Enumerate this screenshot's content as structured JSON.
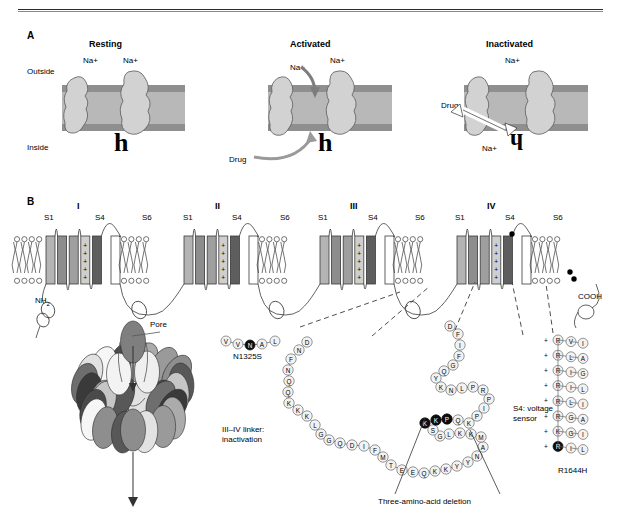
{
  "figure": {
    "panel_a_letter": "A",
    "panel_b_letter": "B"
  },
  "panel_a": {
    "states": [
      {
        "title": "Resting",
        "na_labels": [
          "Na+",
          "Na+"
        ],
        "gate_letter_top": "3",
        "gate_letter_bottom": "h",
        "r_letter": "R"
      },
      {
        "title": "Activated",
        "na_labels": [
          "Na+",
          "Na+"
        ],
        "gate_letter_top": "3",
        "gate_letter_bottom": "h",
        "r_letter": "R",
        "drug_label": "Drug"
      },
      {
        "title": "Inactivated",
        "na_labels": [
          "Na+",
          "Na+"
        ],
        "gate_letter_top": "3",
        "gate_letter_bottom": "h",
        "r_letter": "R",
        "drug_label": "Drug"
      }
    ],
    "outside_label": "Outside",
    "inside_label": "Inside",
    "membrane_color": "#b8b8b8",
    "membrane_edge_color": "#8f8f8f",
    "protein_fill": "#d2d2d2"
  },
  "panel_b": {
    "domain_labels": [
      "I",
      "II",
      "III",
      "IV"
    ],
    "segment_labels": [
      "S1",
      "S4",
      "S6"
    ],
    "terminus_n": "NH2",
    "terminus_c": "COOH",
    "colors": {
      "s1": "#b4b4b4",
      "s2": "#8d8d8d",
      "s3": "#9f9f9f",
      "s4": "#cfcfcf",
      "s5": "#5e5e5e",
      "s6": "#ffffff",
      "stroke": "#3a3a3a"
    },
    "s4_plus": "+"
  },
  "pore": {
    "label": "Pore"
  },
  "mutations": {
    "n1325s": {
      "label": "N1325S",
      "residues": [
        "V",
        "V",
        "N",
        "A",
        "L"
      ],
      "highlight_index": 2
    },
    "r1644h": {
      "label": "R1644H",
      "sensor_label_line1": "S4: voltage",
      "sensor_label_line2": "sensor",
      "rows": [
        {
          "plus": "+",
          "residues": [
            "R",
            "V",
            "I"
          ],
          "highlight": false
        },
        {
          "plus": "+",
          "residues": [
            "R",
            "L",
            "A"
          ],
          "highlight": false
        },
        {
          "plus": "+",
          "residues": [
            "R",
            "I",
            "G"
          ],
          "highlight": false
        },
        {
          "plus": "+",
          "residues": [
            "R",
            "I",
            "L"
          ],
          "highlight": false
        },
        {
          "plus": "+",
          "residues": [
            "R",
            "L",
            "I"
          ],
          "highlight": false
        },
        {
          "plus": "+",
          "residues": [
            "R",
            "G",
            "A"
          ],
          "highlight": false
        },
        {
          "plus": "+",
          "residues": [
            "K",
            "G",
            "I"
          ],
          "highlight": false
        },
        {
          "plus": "+",
          "residues": [
            "R",
            "I",
            "L"
          ],
          "highlight": true
        }
      ]
    },
    "deletion": {
      "label": "Three-amino-acid deletion",
      "residues": [
        "K",
        "P",
        "Q"
      ]
    }
  },
  "linker": {
    "label_line1": "III–IV linker:",
    "label_line2": "inactivation",
    "sequence_left_down": [
      "D",
      "N",
      "F",
      "N",
      "Q",
      "Q",
      "K",
      "K",
      "K",
      "L",
      "G",
      "G"
    ],
    "sequence_bottom_left": [
      "Q",
      "D",
      "I",
      "F",
      "M",
      "T",
      "E",
      "E"
    ],
    "sequence_bottom_right": [
      "Q",
      "K",
      "K",
      "Y",
      "Y"
    ],
    "sequence_right_up": [
      "N",
      "A",
      "M",
      "K",
      "K",
      "L",
      "G",
      "S",
      "K",
      "K",
      "P",
      "Q",
      "K",
      "P",
      "I",
      "P",
      "R",
      "P",
      "L",
      "N",
      "K",
      "Y",
      "Q",
      "G",
      "F",
      "I",
      "F",
      "D"
    ]
  }
}
